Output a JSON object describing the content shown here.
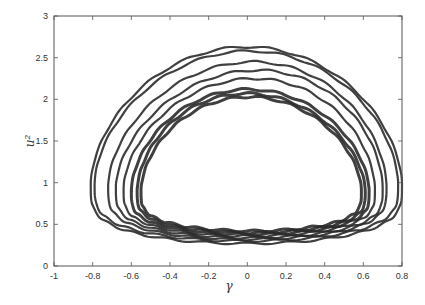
{
  "chart_data": {
    "type": "line",
    "title": "",
    "xlabel": "γ",
    "ylabel": "u²",
    "xlim": [
      -1,
      0.8
    ],
    "ylim": [
      0,
      3
    ],
    "x_ticks": [
      -1,
      -0.8,
      -0.6,
      -0.4,
      -0.2,
      0,
      0.2,
      0.4,
      0.6,
      0.8
    ],
    "x_tick_labels": [
      "-1",
      "-0.8",
      "-0.6",
      "-0.4",
      "-0.2",
      "0",
      "0.2",
      "0.4",
      "0.6",
      "0.8"
    ],
    "y_ticks": [
      0,
      0.5,
      1,
      1.5,
      2,
      2.5,
      3
    ],
    "y_tick_labels": [
      "0",
      "0.5",
      "1",
      "1.5",
      "2",
      "2.5",
      "3"
    ],
    "grid": false,
    "legend": null,
    "series": [
      {
        "name": "orbit-1",
        "xmin": -0.81,
        "xmax": 0.8,
        "ymin": 0.27,
        "ymax": 2.63,
        "ymax_x": 0.0
      },
      {
        "name": "orbit-2",
        "xmin": -0.79,
        "xmax": 0.78,
        "ymin": 0.3,
        "ymax": 2.58,
        "ymax_x": 0.02
      },
      {
        "name": "orbit-3",
        "xmin": -0.72,
        "xmax": 0.72,
        "ymin": 0.32,
        "ymax": 2.45,
        "ymax_x": 0.05
      },
      {
        "name": "orbit-4",
        "xmin": -0.68,
        "xmax": 0.7,
        "ymin": 0.34,
        "ymax": 2.35,
        "ymax_x": 0.08
      },
      {
        "name": "orbit-5",
        "xmin": -0.64,
        "xmax": 0.66,
        "ymin": 0.36,
        "ymax": 2.25,
        "ymax_x": 0.05
      },
      {
        "name": "orbit-6",
        "xmin": -0.6,
        "xmax": 0.63,
        "ymin": 0.38,
        "ymax": 2.12,
        "ymax_x": 0.0
      },
      {
        "name": "orbit-7",
        "xmin": -0.57,
        "xmax": 0.61,
        "ymin": 0.4,
        "ymax": 2.07,
        "ymax_x": -0.02
      },
      {
        "name": "orbit-8",
        "xmin": -0.55,
        "xmax": 0.59,
        "ymin": 0.42,
        "ymax": 2.03,
        "ymax_x": 0.0
      }
    ]
  },
  "style": {
    "line_color": "#2b2b2b",
    "axis_color": "#555555"
  }
}
